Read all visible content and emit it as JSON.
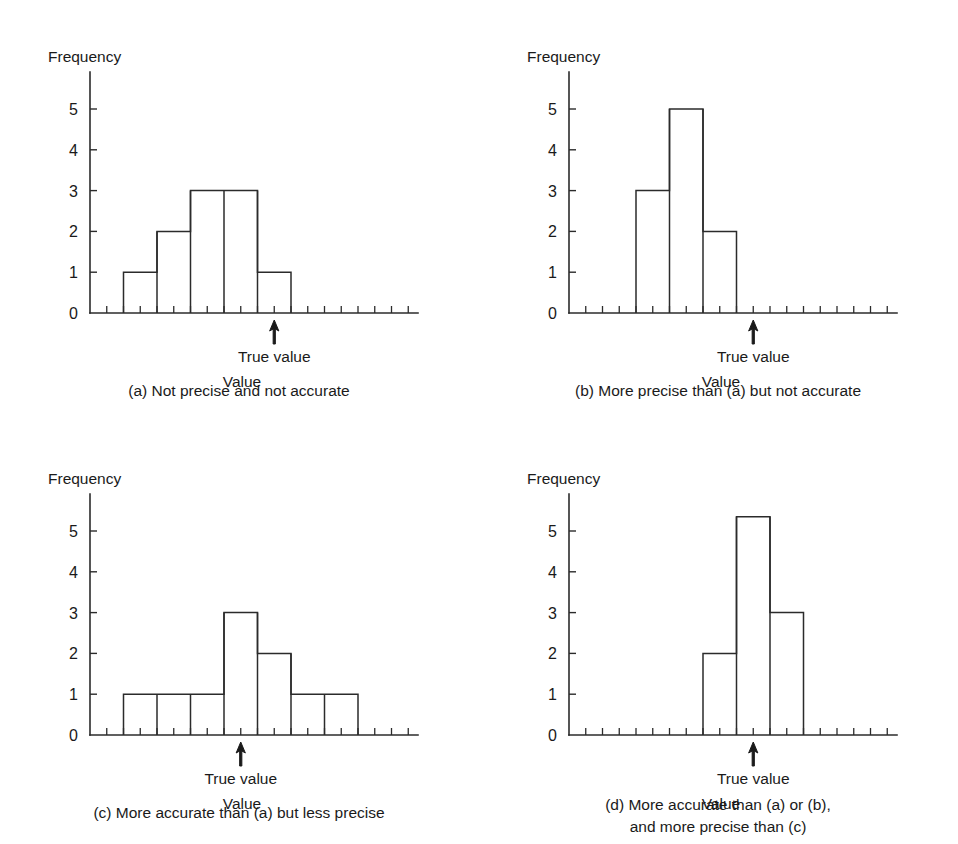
{
  "figure": {
    "panel_count": 4,
    "axis_titles": {
      "y": "Frequency",
      "x": "Value"
    },
    "annotation_label": "True value",
    "y_tick_labels": [
      "0",
      "1",
      "2",
      "3",
      "4",
      "5"
    ]
  },
  "panels": {
    "a": {
      "id": "a",
      "caption": "(a) Not precise and not accurate",
      "caption_line2": "",
      "ylabel": "Frequency",
      "xlabel": "Value",
      "annotation": "True value"
    },
    "b": {
      "id": "b",
      "caption": "(b) More precise than (a) but not accurate",
      "caption_line2": "",
      "ylabel": "Frequency",
      "xlabel": "Value",
      "annotation": "True value"
    },
    "c": {
      "id": "c",
      "caption": "(c) More accurate than (a) but less precise",
      "caption_line2": "",
      "ylabel": "Frequency",
      "xlabel": "Value",
      "annotation": "True value"
    },
    "d": {
      "id": "d",
      "caption": "(d) More accurate than (a) or (b),",
      "caption_line2": "and more precise than (c)",
      "ylabel": "Frequency",
      "xlabel": "Value",
      "annotation": "True value"
    }
  },
  "chart_data": [
    {
      "type": "bar",
      "panel": "a",
      "title": "(a) Not precise and not accurate",
      "xlabel": "Value",
      "ylabel": "Frequency",
      "ylim": [
        0,
        5.8
      ],
      "yticks": [
        0,
        1,
        2,
        3,
        4,
        5
      ],
      "grid": false,
      "legend": "none",
      "bin_count": 10,
      "categories": [
        "1",
        "2",
        "3",
        "4",
        "5",
        "6",
        "7",
        "8",
        "9",
        "10"
      ],
      "values": [
        0,
        1,
        2,
        3,
        3,
        1,
        0,
        0,
        0,
        0
      ],
      "true_value_bin": 6,
      "annotations": [
        {
          "text": "True value",
          "bin": 6,
          "kind": "arrow-up"
        }
      ]
    },
    {
      "type": "bar",
      "panel": "b",
      "title": "(b) More precise than (a) but not accurate",
      "xlabel": "Value",
      "ylabel": "Frequency",
      "ylim": [
        0,
        5.8
      ],
      "yticks": [
        0,
        1,
        2,
        3,
        4,
        5
      ],
      "grid": false,
      "legend": "none",
      "bin_count": 10,
      "categories": [
        "1",
        "2",
        "3",
        "4",
        "5",
        "6",
        "7",
        "8",
        "9",
        "10"
      ],
      "values": [
        0,
        0,
        3,
        5,
        2,
        0,
        0,
        0,
        0,
        0
      ],
      "true_value_bin": 6,
      "annotations": [
        {
          "text": "True value",
          "bin": 6,
          "kind": "arrow-up"
        }
      ]
    },
    {
      "type": "bar",
      "panel": "c",
      "title": "(c) More accurate than (a) but less precise",
      "xlabel": "Value",
      "ylabel": "Frequency",
      "ylim": [
        0,
        5.8
      ],
      "yticks": [
        0,
        1,
        2,
        3,
        4,
        5
      ],
      "grid": false,
      "legend": "none",
      "bin_count": 10,
      "categories": [
        "1",
        "2",
        "3",
        "4",
        "5",
        "6",
        "7",
        "8",
        "9",
        "10"
      ],
      "values": [
        0,
        1,
        1,
        1,
        3,
        2,
        1,
        1,
        0,
        0
      ],
      "true_value_bin": 5,
      "annotations": [
        {
          "text": "True value",
          "bin": 5,
          "kind": "arrow-up"
        }
      ]
    },
    {
      "type": "bar",
      "panel": "d",
      "title": "(d) More accurate than (a) or (b), and more precise than (c)",
      "xlabel": "Value",
      "ylabel": "Frequency",
      "ylim": [
        0,
        5.8
      ],
      "yticks": [
        0,
        1,
        2,
        3,
        4,
        5
      ],
      "grid": false,
      "legend": "none",
      "bin_count": 10,
      "categories": [
        "1",
        "2",
        "3",
        "4",
        "5",
        "6",
        "7",
        "8",
        "9",
        "10"
      ],
      "values": [
        0,
        0,
        0,
        0,
        2,
        5.35,
        3,
        0,
        0,
        0
      ],
      "true_value_bin": 6,
      "annotations": [
        {
          "text": "True value",
          "bin": 6,
          "kind": "arrow-up"
        }
      ]
    }
  ]
}
